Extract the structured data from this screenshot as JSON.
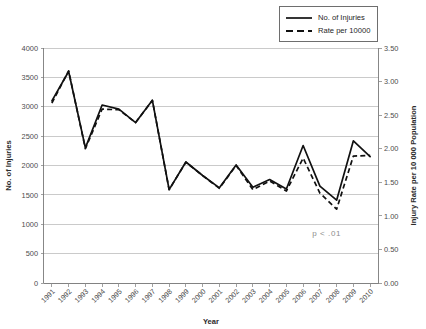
{
  "chart_data": {
    "type": "line",
    "title": "",
    "subtitle": "",
    "xlabel": "Year",
    "ylabel": "No. of Injuries",
    "y2label": "Injury Rate per 10 000 Population",
    "grid": true,
    "legend_position": "top-right",
    "categories": [
      "1991",
      "1992",
      "1993",
      "1994",
      "1995",
      "1996",
      "1997",
      "1998",
      "1999",
      "2000",
      "2001",
      "2002",
      "2003",
      "2004",
      "2005",
      "2006",
      "2007",
      "2008",
      "2009",
      "2010"
    ],
    "x": [
      1991,
      1992,
      1993,
      1994,
      1995,
      1996,
      1997,
      1998,
      1999,
      2000,
      2001,
      2002,
      2003,
      2004,
      2005,
      2006,
      2007,
      2008,
      2009,
      2010
    ],
    "ylim": [
      0,
      4000
    ],
    "y2lim": [
      0.0,
      3.5
    ],
    "yticks": [
      0,
      500,
      1000,
      1500,
      2000,
      2500,
      3000,
      3500,
      4000
    ],
    "ytick_labels": [
      "0",
      "500",
      "1000",
      "1500",
      "2000",
      "2500",
      "3000",
      "3500",
      "4000"
    ],
    "y2ticks": [
      0.0,
      0.5,
      1.0,
      1.5,
      2.0,
      2.5,
      3.0,
      3.5
    ],
    "y2tick_labels": [
      "0.00",
      "0.50",
      "1.00",
      "1.50",
      "2.00",
      "2.50",
      "3.00",
      "3.50"
    ],
    "series": [
      {
        "name": "No. of Injuries",
        "axis": "left",
        "style": "solid",
        "color": "#111111",
        "values": [
          3100,
          3600,
          2300,
          3030,
          2960,
          2730,
          3110,
          1590,
          2060,
          1830,
          1620,
          2010,
          1630,
          1760,
          1600,
          2340,
          1650,
          1410,
          2420,
          2150
        ]
      },
      {
        "name": "Rate per 10000",
        "axis": "right",
        "style": "dashed",
        "color": "#111111",
        "values": [
          2.68,
          3.16,
          2.0,
          2.59,
          2.58,
          2.39,
          2.72,
          1.39,
          1.8,
          1.6,
          1.41,
          1.75,
          1.39,
          1.52,
          1.37,
          1.86,
          1.34,
          1.1,
          1.89,
          1.9
        ]
      }
    ],
    "annotations": [
      {
        "text": "p < .01",
        "x_value": 2007.4,
        "y_value": 800
      }
    ]
  },
  "legend": {
    "items": [
      {
        "label": "No. of Injuries",
        "style": "solid"
      },
      {
        "label": "Rate per 10000",
        "style": "dashed"
      }
    ]
  }
}
